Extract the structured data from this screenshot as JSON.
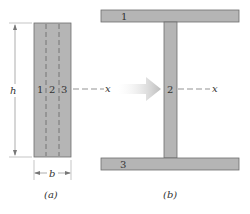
{
  "figure_a": {
    "caption": "(a)",
    "strip_labels": [
      "1",
      "2",
      "3"
    ],
    "height_label": "h",
    "width_label": "b",
    "axis_label": "x"
  },
  "figure_b": {
    "caption": "(b)",
    "top_flange_label": "1",
    "web_label": "2",
    "bottom_flange_label": "3",
    "axis_label": "x"
  },
  "colors": {
    "section_fill": "#b5b5b5",
    "section_stroke": "#6e6e6e",
    "arrow_fill": "#c8c8c8"
  }
}
